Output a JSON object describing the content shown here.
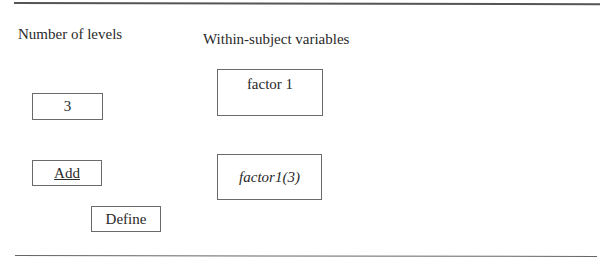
{
  "labels": {
    "number_of_levels": "Number of levels",
    "within_subject_variables": "Within-subject variables"
  },
  "inputs": {
    "levels_value": "3",
    "factor_name": "factor 1"
  },
  "buttons": {
    "add": "Add",
    "define": "Define"
  },
  "variables_list": {
    "items": [
      "factor1(3)"
    ]
  }
}
